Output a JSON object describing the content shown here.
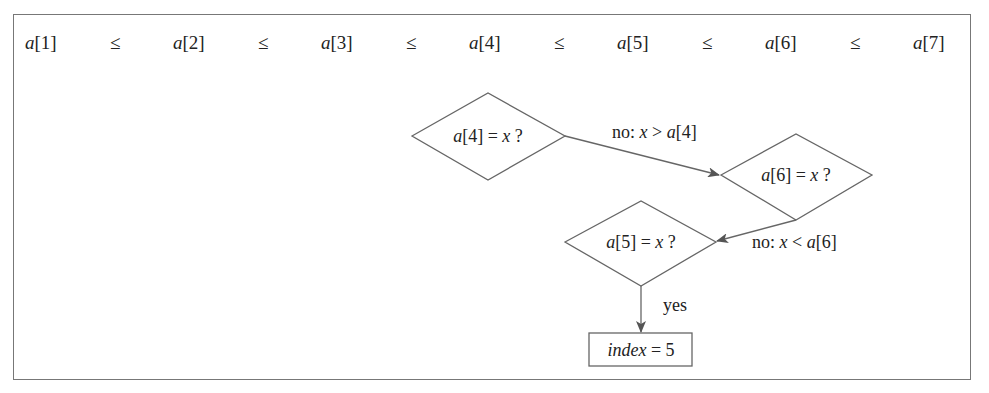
{
  "sequence": {
    "items": [
      {
        "var": "a",
        "idx": "[1]"
      },
      {
        "var": "a",
        "idx": "[2]"
      },
      {
        "var": "a",
        "idx": "[3]"
      },
      {
        "var": "a",
        "idx": "[4]"
      },
      {
        "var": "a",
        "idx": "[5]"
      },
      {
        "var": "a",
        "idx": "[6]"
      },
      {
        "var": "a",
        "idx": "[7]"
      }
    ],
    "relation": "≤"
  },
  "nodes": {
    "n4": {
      "var": "a",
      "idx": "[4]",
      "eq": " = ",
      "x": "x",
      "q": " ?"
    },
    "n6": {
      "var": "a",
      "idx": "[6]",
      "eq": " = ",
      "x": "x",
      "q": " ?"
    },
    "n5": {
      "var": "a",
      "idx": "[5]",
      "eq": " = ",
      "x": "x",
      "q": " ?"
    },
    "result": {
      "var": "index",
      "rest": " = 5"
    }
  },
  "edges": {
    "e1": {
      "prefix": "no: ",
      "x": "x",
      "op": " > ",
      "a": "a",
      "idx": "[4]"
    },
    "e2": {
      "prefix": "no: ",
      "x": "x",
      "op": " < ",
      "a": "a",
      "idx": "[6]"
    },
    "e3": {
      "label": "yes"
    }
  },
  "colors": {
    "stroke": "#666666",
    "text": "#222222",
    "border": "#777777"
  }
}
